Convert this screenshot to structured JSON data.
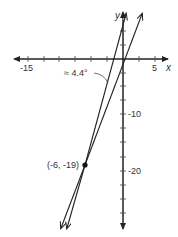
{
  "diagram": {
    "type": "coordinate-graph",
    "x_axis": {
      "label": "x",
      "tick_labels": [
        {
          "value": -15,
          "text": "-15"
        },
        {
          "value": 5,
          "text": "5"
        }
      ],
      "tick_interval": 2.5
    },
    "y_axis": {
      "label": "y",
      "tick_labels": [
        {
          "value": -10,
          "text": "-10"
        },
        {
          "value": -20,
          "text": "-20"
        }
      ],
      "tick_interval": 2.5
    },
    "point": {
      "x": -6,
      "y": -19,
      "label": "(-6, -19)"
    },
    "angle_annotation": "≈ 4.4°",
    "lines": [
      {
        "name": "steeper line",
        "passes_through": "(-6, -19)"
      },
      {
        "name": "less steep line",
        "passes_through": "(-6, -19)"
      }
    ],
    "colors": {
      "stroke": "#222222",
      "text": "#333333"
    }
  }
}
